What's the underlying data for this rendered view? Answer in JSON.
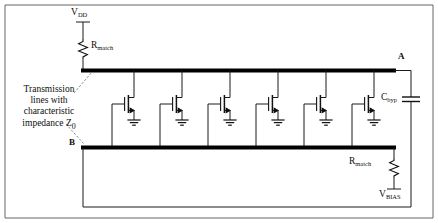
{
  "diagram": {
    "annotation": {
      "line1": "Transmission",
      "line2": "lines with",
      "line3": "characteristic",
      "line4": "impedance Z",
      "sub4": "0"
    },
    "nodes": [
      {
        "id": "node-a",
        "label": "A"
      },
      {
        "id": "node-b",
        "label": "B"
      }
    ],
    "components": [
      {
        "id": "supply-vdd",
        "label": "V",
        "sub": "DD",
        "kind": "supply"
      },
      {
        "id": "resistor-rmatch-top",
        "label": "R",
        "sub": "match",
        "kind": "resistor"
      },
      {
        "id": "capacitor-cbyp",
        "label": "C",
        "sub": "byp",
        "kind": "capacitor"
      },
      {
        "id": "resistor-rmatch-bottom",
        "label": "R",
        "sub": "match",
        "kind": "resistor"
      },
      {
        "id": "supply-vbias",
        "label": "V",
        "sub": "BIAS",
        "kind": "supply"
      }
    ],
    "transistor_count": 6,
    "colors": {
      "wire": "#1b1b1b",
      "transmission_line": "#000000",
      "frame": "#555555",
      "background": "#ffffff"
    }
  }
}
